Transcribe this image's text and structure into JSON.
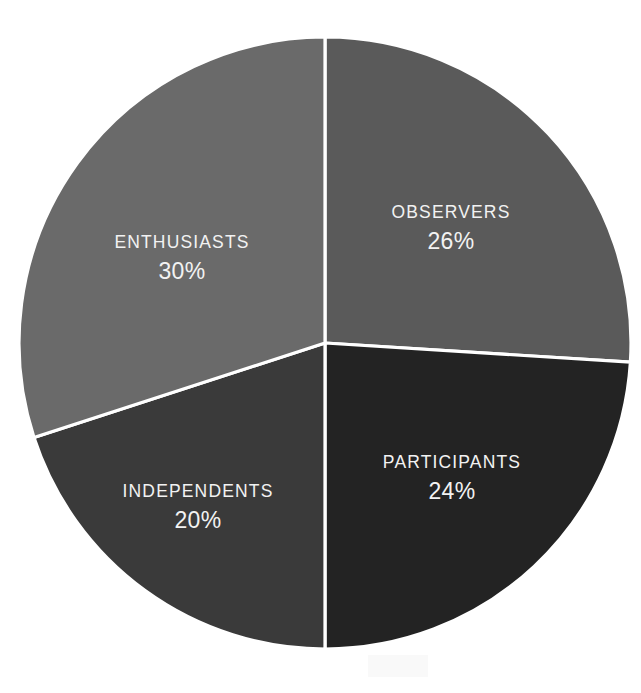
{
  "chart_data": {
    "type": "pie",
    "title": "",
    "subtitle": "",
    "xlabel": "",
    "ylabel": "",
    "legend_position": "none",
    "grid": false,
    "labels_inside_slices": true,
    "value_unit": "%",
    "categories": [
      "OBSERVERS",
      "PARTICIPANTS",
      "INDEPENDENTS",
      "ENTHUSIASTS"
    ],
    "values": [
      26,
      24,
      20,
      30
    ],
    "value_labels": [
      "26%",
      "24%",
      "20%",
      "30%"
    ],
    "colors": [
      "#5a5a5a",
      "#232323",
      "#3a3a3a",
      "#6a6a6a"
    ],
    "start_angle_deg": 0,
    "direction": "clockwise",
    "slices": [
      {
        "name": "OBSERVERS",
        "value": 26,
        "value_label": "26%",
        "color": "#5a5a5a",
        "start_angle_deg": 0,
        "end_angle_deg": 93.6,
        "label_x": 451,
        "label_y": 213
      },
      {
        "name": "PARTICIPANTS",
        "value": 24,
        "value_label": "24%",
        "color": "#232323",
        "start_angle_deg": 93.6,
        "end_angle_deg": 180.0,
        "label_x": 452,
        "label_y": 463
      },
      {
        "name": "INDEPENDENTS",
        "value": 20,
        "value_label": "20%",
        "color": "#3a3a3a",
        "start_angle_deg": 180.0,
        "end_angle_deg": 252.0,
        "label_x": 198,
        "label_y": 492
      },
      {
        "name": "ENTHUSIASTS",
        "value": 30,
        "value_label": "30%",
        "color": "#6a6a6a",
        "start_angle_deg": 252.0,
        "end_angle_deg": 360.0,
        "label_x": 182,
        "label_y": 243
      }
    ],
    "geometry": {
      "center_x": 325,
      "center_y": 343,
      "radius": 306,
      "separator_color": "#ffffff",
      "separator_width": 3.2
    },
    "background_color": "#ffffff",
    "label_text_color": "#f2f2f2"
  }
}
